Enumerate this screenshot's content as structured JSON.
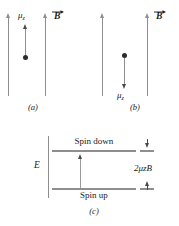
{
  "figure": {
    "panels": [
      {
        "id": "a",
        "caption": "(a)",
        "dipole_label": "μ",
        "dipole_subscript": "z",
        "dipole_direction": "up",
        "field_label": "B",
        "field_direction": "up",
        "field_vector_notation": "arrow-over"
      },
      {
        "id": "b",
        "caption": "(b)",
        "dipole_label": "μ",
        "dipole_subscript": "z",
        "dipole_direction": "down",
        "field_label": "B",
        "field_direction": "up",
        "field_vector_notation": "arrow-over"
      },
      {
        "id": "c",
        "caption": "(c)",
        "axis_label": "E",
        "upper_level_label": "Spin down",
        "lower_level_label": "Spin up",
        "splitting_label": "2μ",
        "splitting_subscript": "z",
        "splitting_suffix": "B"
      }
    ]
  },
  "colors": {
    "line_gray": "#8e8e8e",
    "dot_black": "#2b2b2b",
    "arrow_gray": "#4a4a4a",
    "text": "#1a1a1a",
    "background": "#ffffff"
  }
}
